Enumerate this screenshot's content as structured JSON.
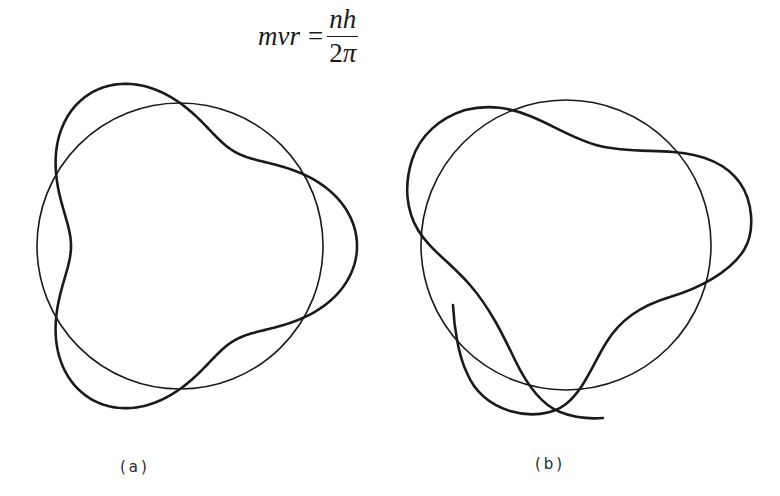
{
  "equation": {
    "lhs": "mvr",
    "equals": "=",
    "numerator": "nh",
    "denominator_coefficient": "2",
    "denominator_symbol": "π"
  },
  "figures": [
    {
      "id": "a",
      "label": "(a)",
      "description": "Closed standing wave (whole number of wavelengths) around a circular orbit",
      "orbit": {
        "cx": 180,
        "cy": 246,
        "r": 143
      },
      "wave": {
        "closed": true,
        "wavelengths": 3,
        "amplitude": 34
      }
    },
    {
      "id": "b",
      "label": "(b)",
      "description": "Non-closing wave around a circular orbit (not a whole number of wavelengths)",
      "orbit": {
        "cx": 566,
        "cy": 245,
        "r": 145
      },
      "wave": {
        "closed": false
      }
    }
  ],
  "colors": {
    "line": "#1a1a1a",
    "background": "#ffffff"
  }
}
